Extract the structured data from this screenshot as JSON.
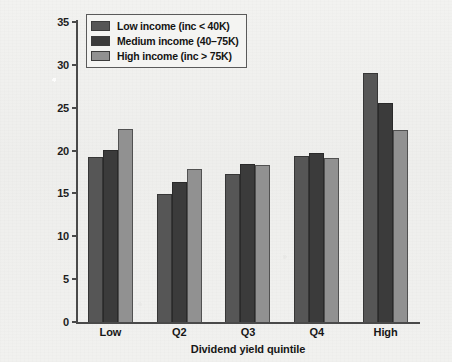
{
  "chart_data": {
    "type": "bar",
    "title": "",
    "xlabel": "Dividend yield quintile",
    "ylabel": "Portfolio weight (in %)",
    "categories": [
      "Low",
      "Q2",
      "Q3",
      "Q4",
      "High"
    ],
    "series": [
      {
        "name": "Low income (inc < 40K)",
        "color": "#565656",
        "values": [
          19.3,
          14.9,
          17.3,
          19.4,
          29.1
        ]
      },
      {
        "name": "Medium income (40–75K)",
        "color": "#3b3b3b",
        "values": [
          20.1,
          16.3,
          18.4,
          19.7,
          25.5
        ]
      },
      {
        "name": "High income (inc > 75K)",
        "color": "#919191",
        "values": [
          22.5,
          17.8,
          18.3,
          19.1,
          22.4
        ]
      }
    ],
    "ylim": [
      0,
      35
    ],
    "yticks": [
      0,
      5,
      10,
      15,
      20,
      25,
      30,
      35
    ],
    "ytick_labels": [
      "0",
      "5",
      "10",
      "15",
      "20",
      "25",
      "30",
      "35"
    ],
    "grid": false,
    "legend_position": "top-left",
    "background_color": "#f0f0ee",
    "axis_color": "#4a4a4a"
  }
}
